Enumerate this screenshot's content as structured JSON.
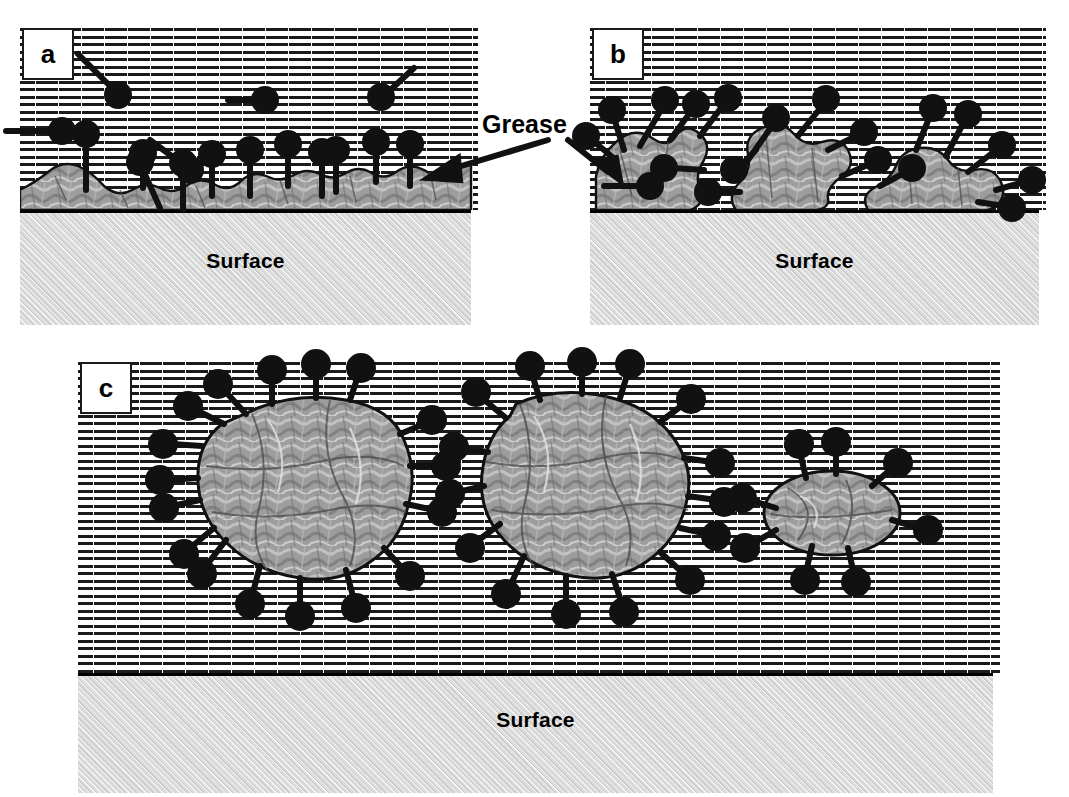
{
  "figure": {
    "background_color": "#ffffff",
    "ink_color": "#000000"
  },
  "labels": {
    "grease": "Grease",
    "surface": "Surface"
  },
  "panels": [
    {
      "id": "a",
      "letter": "a",
      "caption_letter": "a",
      "surface_label": "Surface",
      "stage": "Surfactant molecules adsorb onto the grease layer spread on the surface",
      "box": {
        "x": 20,
        "y": 26,
        "w": 458,
        "h": 296
      },
      "water": {
        "x": 20,
        "y": 26,
        "w": 458,
        "h": 184
      },
      "surface": {
        "x": 20,
        "y": 210,
        "w": 451,
        "h": 112
      },
      "surface_label_y": 246,
      "badge": {
        "x": 22,
        "y": 28,
        "w": 48,
        "h": 48
      }
    },
    {
      "id": "b",
      "letter": "b",
      "caption_letter": "b",
      "surface_label": "Surface",
      "stage": "Grease rolls up into droplets as surfactant lowers interfacial tension",
      "box": {
        "x": 590,
        "y": 26,
        "w": 456,
        "h": 296
      },
      "water": {
        "x": 590,
        "y": 26,
        "w": 456,
        "h": 184
      },
      "surface": {
        "x": 590,
        "y": 210,
        "w": 449,
        "h": 112
      },
      "surface_label_y": 246,
      "badge": {
        "x": 592,
        "y": 28,
        "w": 48,
        "h": 48
      }
    },
    {
      "id": "c",
      "letter": "c",
      "caption_letter": "c",
      "surface_label": "Surface",
      "stage": "Grease droplets detach and are emulsified in the bulk solution, leaving a clean surface",
      "box": {
        "x": 78,
        "y": 360,
        "w": 922,
        "h": 430
      },
      "water": {
        "x": 78,
        "y": 360,
        "w": 922,
        "h": 313
      },
      "surface": {
        "x": 78,
        "y": 673,
        "w": 915,
        "h": 117
      },
      "surface_label_y": 705,
      "badge": {
        "x": 80,
        "y": 362,
        "w": 48,
        "h": 48
      }
    }
  ],
  "grease_annotation": {
    "text": "Grease",
    "text_x": 482,
    "text_y": 110,
    "arrows": [
      {
        "name": "grease-arrow-left",
        "x1": 548,
        "y1": 140,
        "x2": 428,
        "y2": 176
      },
      {
        "name": "grease-arrow-right",
        "x1": 568,
        "y1": 140,
        "x2": 618,
        "y2": 178
      }
    ]
  },
  "legend_semantics": {
    "water_phase": "dashed-hatch region representing aqueous wash liquor",
    "grease_phase": "mottled gray irregular blobs",
    "surfactant": "black circular hydrophilic head with straight hydrophobic tail",
    "substrate": "light gray hatched block labelled Surface"
  }
}
